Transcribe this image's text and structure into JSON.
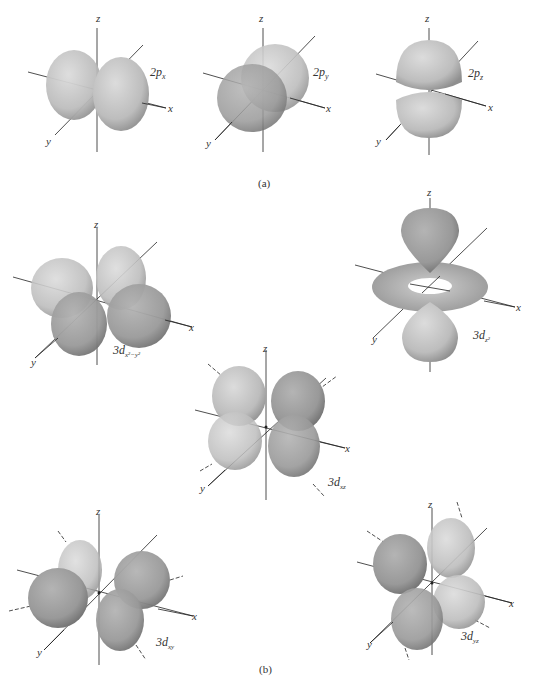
{
  "figure": {
    "panel_a": {
      "caption": "(a)",
      "orbitals": [
        {
          "id": "2px",
          "label_main": "2p",
          "label_sub": "x"
        },
        {
          "id": "2py",
          "label_main": "2p",
          "label_sub": "y"
        },
        {
          "id": "2pz",
          "label_main": "2p",
          "label_sub": "z"
        }
      ]
    },
    "panel_b": {
      "caption": "(b)",
      "orbitals": [
        {
          "id": "3dx2-y2",
          "label_main": "3d",
          "label_sub": "x²−y²"
        },
        {
          "id": "3dz2",
          "label_main": "3d",
          "label_sub": "z²"
        },
        {
          "id": "3dxz",
          "label_main": "3d",
          "label_sub": "xz"
        },
        {
          "id": "3dxy",
          "label_main": "3d",
          "label_sub": "xy"
        },
        {
          "id": "3dyz",
          "label_main": "3d",
          "label_sub": "yz"
        }
      ]
    },
    "axes": {
      "x": "x",
      "y": "y",
      "z": "z"
    },
    "colors": {
      "lobe_light": "#c8c8c8",
      "lobe_dark": "#8e8e8e",
      "axis": "#222222",
      "background": "#ffffff"
    }
  }
}
